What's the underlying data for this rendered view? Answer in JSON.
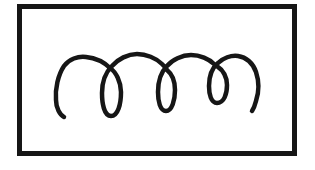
{
  "figure": {
    "background_color": "#ffffff",
    "ink_color": "#161616",
    "frame": {
      "x": "19.5",
      "y": "6.5",
      "width": "275",
      "height": "147",
      "stroke_width": "5",
      "stroke_color": "#161616"
    },
    "squiggle": {
      "stroke_width": "4.5",
      "stroke_color": "#161616",
      "path": "M 64 117 C 60 115 56 108 56 100 C 55 89 58 75 64 66 C 69 59 78 56 86 57 C 95 58 104 62 110 68 C 116 72 121 82 121 92 C 121 104 118 116 111 116 C 104 116 102 103 102 93 C 102 82 106 72 112 66 C 118 59 128 54 137 54 C 146 54 156 58 162 64 C 164 66 166 68 167 70 C 172 74 175 82 175 90 C 175 100 172 111 166 111 C 160 111 158 101 158 92 C 158 82 161 72 167 66 C 172 60 182 55 191 55 C 200 55 209 59 214 64 C 216 65 217 66 218 67 C 223 70 227 77 227 85 C 227 94 224 103 217 103 C 211 103 209 94 209 86 C 209 77 212 68 218 63 C 223 58 231 55 238 56 C 246 57 253 63 256 72 C 259 81 259 92 256 101 C 255 105 254 108 252 111"
    }
  }
}
